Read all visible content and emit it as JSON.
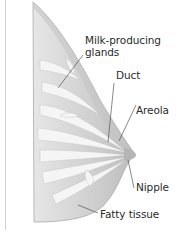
{
  "diagram": {
    "labels": {
      "glands_line1": "Milk-producing",
      "glands_line2": "glands",
      "duct": "Duct",
      "areola": "Areola",
      "nipple": "Nipple",
      "fatty": "Fatty tissue"
    },
    "colors": {
      "tissue": "#d6d6d6",
      "tissue_dark": "#b9b9b9",
      "lobules": "#f4f4f4",
      "leader_line": "#555555",
      "text": "#2a2a2a"
    }
  }
}
